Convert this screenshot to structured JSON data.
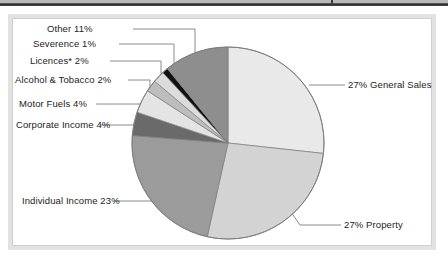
{
  "figure": {
    "background_color": "#ffffff",
    "frame_color": "#e2e2e2",
    "rule_color": "#2b2b2b"
  },
  "chart_data": {
    "type": "pie",
    "title": "",
    "subtitle": "",
    "xlabel": "",
    "ylabel": "",
    "legend_position": "none",
    "grid": false,
    "units": "percent",
    "start_angle_deg": 0,
    "direction": "clockwise",
    "categories": [
      "General Sales",
      "Property",
      "Individual Income",
      "Corporate Income",
      "Motor Fuels",
      "Alcohol & Tobacco",
      "Licences*",
      "Severence",
      "Other"
    ],
    "values": [
      27,
      27,
      23,
      4,
      4,
      2,
      2,
      1,
      11
    ],
    "colors": [
      "#e9e9e9",
      "#d3d3d3",
      "#9b9b9b",
      "#6a6a6a",
      "#e4e4e4",
      "#bdbdbd",
      "#dcdcdc",
      "#111111",
      "#8e8e8e"
    ],
    "slices": [
      {
        "label": "27% General Sales",
        "name": "General Sales",
        "value": 27,
        "color": "#e9e9e9",
        "label_side": "right"
      },
      {
        "label": "27% Property",
        "name": "Property",
        "value": 27,
        "color": "#d3d3d3",
        "label_side": "right"
      },
      {
        "label": "Individual Income 23%",
        "name": "Individual Income",
        "value": 23,
        "color": "#9b9b9b",
        "label_side": "left"
      },
      {
        "label": "Corporate Income 4%",
        "name": "Corporate Income",
        "value": 4,
        "color": "#6a6a6a",
        "label_side": "left"
      },
      {
        "label": "Motor Fuels 4%",
        "name": "Motor Fuels",
        "value": 4,
        "color": "#e4e4e4",
        "label_side": "left"
      },
      {
        "label": "Alcohol & Tobacco 2%",
        "name": "Alcohol & Tobacco",
        "value": 2,
        "color": "#bdbdbd",
        "label_side": "left"
      },
      {
        "label": "Licences* 2%",
        "name": "Licences*",
        "value": 2,
        "color": "#dcdcdc",
        "label_side": "left"
      },
      {
        "label": "Severence 1%",
        "name": "Severence",
        "value": 1,
        "color": "#111111",
        "label_side": "left"
      },
      {
        "label": "Other 11%",
        "name": "Other",
        "value": 11,
        "color": "#8e8e8e",
        "label_side": "left"
      }
    ]
  },
  "labels": {
    "other": "Other 11%",
    "severence": "Severence 1%",
    "licences": "Licences* 2%",
    "alcohol_tobacco": "Alcohol & Tobacco 2%",
    "motor_fuels": "Motor Fuels 4%",
    "corporate_income": "Corporate Income 4%",
    "individual_income": "Individual Income 23%",
    "general_sales": "27% General Sales",
    "property": "27% Property"
  }
}
